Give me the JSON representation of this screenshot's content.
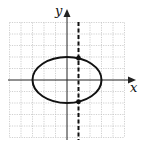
{
  "figure": {
    "type": "graph",
    "axes": {
      "x_label": "x",
      "y_label": "y"
    },
    "grid": {
      "x_range": [
        -5,
        5
      ],
      "y_range": [
        -5,
        5
      ],
      "step": 1,
      "style": "dotted light gray"
    },
    "curves": [
      {
        "kind": "ellipse",
        "center": [
          0,
          0
        ],
        "semi_x": 3,
        "semi_y": 2,
        "style": "solid thick"
      }
    ],
    "lines": [
      {
        "kind": "vertical",
        "x": 1,
        "style": "dashed thick"
      }
    ],
    "points": [
      {
        "x": 1,
        "y": 1.89
      },
      {
        "x": 1,
        "y": -1.89
      }
    ],
    "colors": {
      "curve": "#111111",
      "axis": "#222222",
      "grid": "#bbbbbb"
    }
  }
}
